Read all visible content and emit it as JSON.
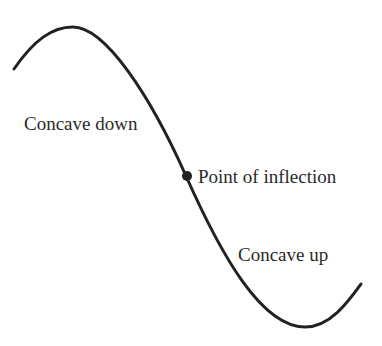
{
  "diagram": {
    "title": "Point of inflection",
    "labels": {
      "concave_down": "Concave down",
      "inflection": "Point of inflection",
      "concave_up": "Concave up"
    },
    "curve": {
      "start": [
        14,
        69
      ],
      "maximum": [
        73,
        27
      ],
      "inflection_point": [
        186,
        176
      ],
      "minimum": [
        305,
        327
      ],
      "end": [
        361,
        284
      ]
    },
    "colors": {
      "curve": "#222222",
      "text": "#2a2a2a",
      "background": "#ffffff"
    }
  }
}
